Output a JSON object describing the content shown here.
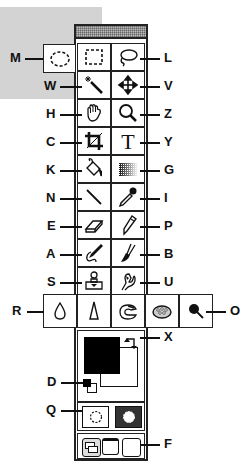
{
  "tools": [
    {
      "key": "M",
      "icon": "elliptical-marquee-icon",
      "side": "left"
    },
    {
      "key": "L",
      "icon": "lasso-icon",
      "side": "right"
    },
    {
      "key": "W",
      "icon": "magic-wand-icon",
      "side": "left"
    },
    {
      "key": "V",
      "icon": "move-icon",
      "side": "right"
    },
    {
      "key": "H",
      "icon": "hand-icon",
      "side": "left"
    },
    {
      "key": "Z",
      "icon": "zoom-icon",
      "side": "right"
    },
    {
      "key": "C",
      "icon": "crop-icon",
      "side": "left"
    },
    {
      "key": "Y",
      "icon": "type-icon",
      "side": "right"
    },
    {
      "key": "K",
      "icon": "paint-bucket-icon",
      "side": "left"
    },
    {
      "key": "G",
      "icon": "gradient-icon",
      "side": "right"
    },
    {
      "key": "N",
      "icon": "line-icon",
      "side": "left"
    },
    {
      "key": "I",
      "icon": "eyedropper-icon",
      "side": "right"
    },
    {
      "key": "E",
      "icon": "eraser-icon",
      "side": "left"
    },
    {
      "key": "P",
      "icon": "pencil-icon",
      "side": "right"
    },
    {
      "key": "A",
      "icon": "airbrush-icon",
      "side": "left"
    },
    {
      "key": "B",
      "icon": "paintbrush-icon",
      "side": "right"
    },
    {
      "key": "S",
      "icon": "rubber-stamp-icon",
      "side": "left"
    },
    {
      "key": "U",
      "icon": "smudge-icon",
      "side": "right"
    },
    {
      "key": "R",
      "icon": "blur-icon",
      "side": "left"
    },
    {
      "key": "O",
      "icon": "burn-icon",
      "side": "right"
    },
    {
      "key": "X",
      "icon": "swap-colors-icon",
      "side": "right"
    },
    {
      "key": "D",
      "icon": "default-colors-icon",
      "side": "left"
    },
    {
      "key": "Q",
      "icon": "quick-mask-icon",
      "side": "left"
    },
    {
      "key": "F",
      "icon": "screen-mode-icon",
      "side": "right"
    }
  ],
  "labels": {
    "M": "M",
    "L": "L",
    "W": "W",
    "V": "V",
    "H": "H",
    "Z": "Z",
    "C": "C",
    "Y": "Y",
    "K": "K",
    "G": "G",
    "N": "N",
    "I": "I",
    "E": "E",
    "P": "P",
    "A": "A",
    "B": "B",
    "S": "S",
    "U": "U",
    "R": "R",
    "O": "O",
    "X": "X",
    "D": "D",
    "Q": "Q",
    "F": "F"
  },
  "colors": {
    "foreground": "#000000",
    "background": "#ffffff",
    "panel_gray": "#d3d3d3"
  }
}
